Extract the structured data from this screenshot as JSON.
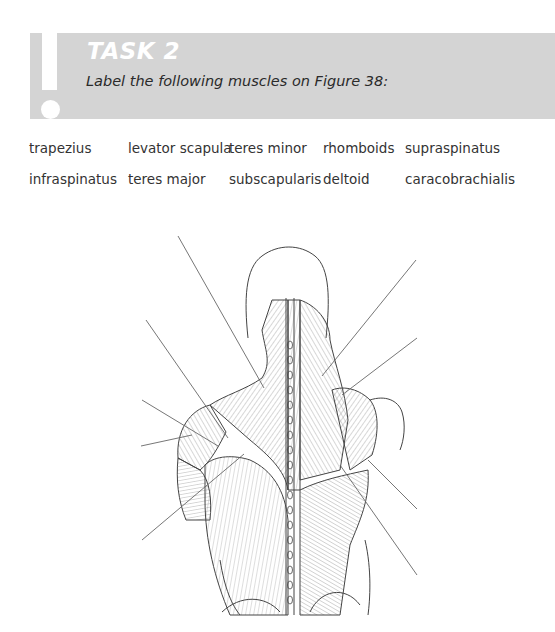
{
  "task": {
    "title": "TASK 2",
    "instruction": "Label the following muscles on Figure 38:",
    "icon": "exclamation-icon",
    "banner_color": "#d4d4d4"
  },
  "terms": {
    "rows": [
      [
        "trapezius",
        "levator scapula",
        "teres minor",
        "rhomboids",
        "supraspinatus"
      ],
      [
        "infraspinatus",
        "teres major",
        "subscapularis",
        "deltoid",
        "caracobrachialis"
      ]
    ]
  },
  "figure": {
    "leader_line_count": 9
  }
}
